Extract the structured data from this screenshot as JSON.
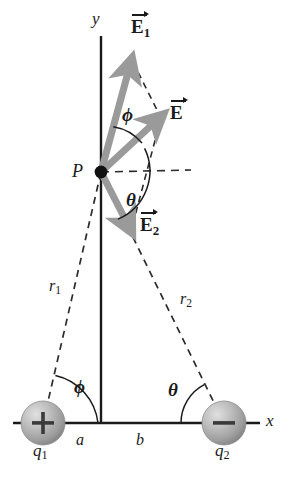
{
  "figure": {
    "background_color": "#ffffff",
    "ink_color": "#1a1a1a",
    "vector_color": "#9a9a9a",
    "sphere_color": "#b0b0b0"
  },
  "axes": {
    "y_label": "y",
    "x_label": "x"
  },
  "point": {
    "label": "P"
  },
  "vectors": [
    {
      "name": "E1",
      "base": "E",
      "subscript": "1"
    },
    {
      "name": "E",
      "base": "E",
      "subscript": ""
    },
    {
      "name": "E2",
      "base": "E",
      "subscript": "2"
    }
  ],
  "vector_labels": {
    "e1_base": "E",
    "e1_sub": "1",
    "e_base": "E",
    "e_sub": "",
    "e2_base": "E",
    "e2_sub": "2"
  },
  "angles": {
    "phi_at_p": "ϕ",
    "theta_at_p": "θ",
    "phi_at_q1": "ϕ",
    "theta_at_q2": "θ"
  },
  "distances": {
    "r1_base": "r",
    "r1_sub": "1",
    "r2_base": "r",
    "r2_sub": "2",
    "a": "a",
    "b": "b"
  },
  "charges": [
    {
      "name": "q1",
      "base": "q",
      "subscript": "1",
      "sign": "+",
      "position": "left"
    },
    {
      "name": "q2",
      "base": "q",
      "subscript": "2",
      "sign": "−",
      "position": "right"
    }
  ],
  "charge_labels": {
    "q1_base": "q",
    "q1_sub": "1",
    "q1_sign": "+",
    "q2_base": "q",
    "q2_sub": "2",
    "q2_sign": "−"
  }
}
